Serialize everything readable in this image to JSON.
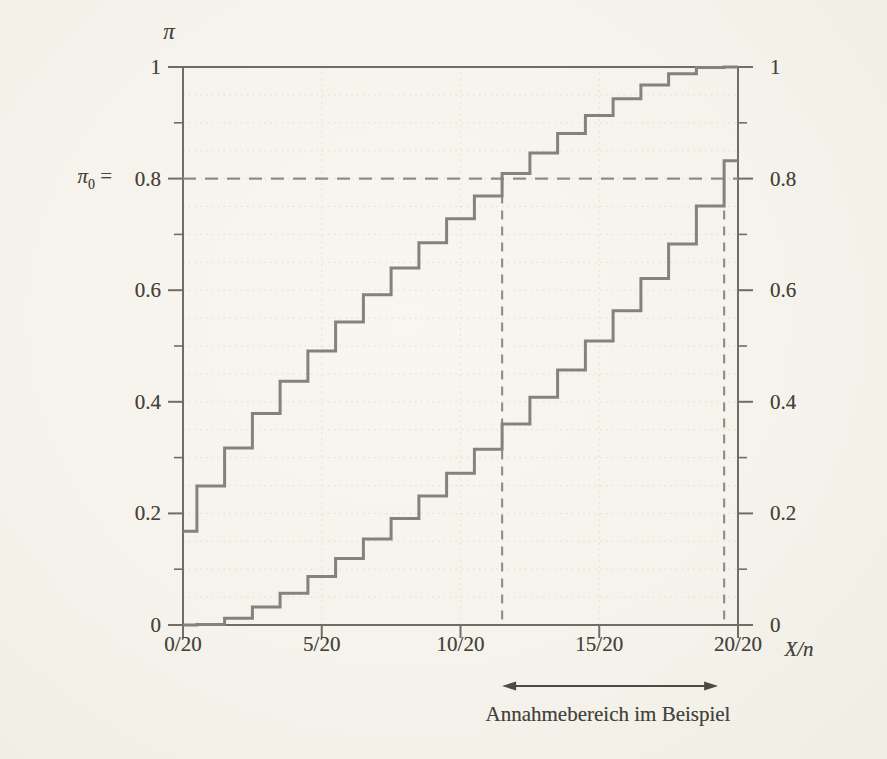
{
  "figure": {
    "pi_axis_title": "π",
    "x_axis_title": "X/n",
    "pi0_label": {
      "pi": "π",
      "sub": "0",
      "eq": " ="
    }
  },
  "axes": {
    "y_left_ticks": [
      {
        "label": "1",
        "value": 1
      },
      {
        "label": "0.8",
        "value": 0.8
      },
      {
        "label": "0.6",
        "value": 0.6
      },
      {
        "label": "0.4",
        "value": 0.4
      },
      {
        "label": "0.2",
        "value": 0.2
      },
      {
        "label": "0",
        "value": 0
      }
    ],
    "y_right_ticks": [
      {
        "label": "1",
        "value": 1
      },
      {
        "label": "0.8",
        "value": 0.8
      },
      {
        "label": "0.6",
        "value": 0.6
      },
      {
        "label": "0.4",
        "value": 0.4
      },
      {
        "label": "0.2",
        "value": 0.2
      },
      {
        "label": "0",
        "value": 0
      }
    ],
    "y_minor_ticks": [
      0.1,
      0.3,
      0.5,
      0.7,
      0.9
    ],
    "x_ticks": [
      {
        "label": "0/20",
        "value": 0
      },
      {
        "label": "5/20",
        "value": 5
      },
      {
        "label": "10/20",
        "value": 10
      },
      {
        "label": "15/20",
        "value": 15
      },
      {
        "label": "20/20",
        "value": 20
      }
    ]
  },
  "chart_data": {
    "type": "line",
    "subtype": "step-confidence-belt",
    "n": 20,
    "x": [
      0,
      1,
      2,
      3,
      4,
      5,
      6,
      7,
      8,
      9,
      10,
      11,
      12,
      13,
      14,
      15,
      16,
      17,
      18,
      19,
      20
    ],
    "series": [
      {
        "name": "upper-confidence-limit",
        "values": [
          0.168,
          0.249,
          0.317,
          0.379,
          0.437,
          0.491,
          0.543,
          0.592,
          0.64,
          0.685,
          0.728,
          0.769,
          0.809,
          0.846,
          0.881,
          0.913,
          0.943,
          0.968,
          0.988,
          0.999,
          1.0
        ]
      },
      {
        "name": "lower-confidence-limit",
        "values": [
          0.0,
          0.001,
          0.012,
          0.032,
          0.057,
          0.087,
          0.119,
          0.154,
          0.191,
          0.231,
          0.272,
          0.315,
          0.36,
          0.408,
          0.457,
          0.509,
          0.563,
          0.621,
          0.683,
          0.751,
          0.832
        ]
      }
    ],
    "pi0": 0.8,
    "acceptance_region": {
      "from_x": 11.5,
      "to_x": 19.5,
      "label": "Annahmebereich im Beispiel"
    },
    "xlabel": "X/n",
    "ylabel": "π",
    "xlim": [
      0,
      20
    ],
    "ylim": [
      0,
      1
    ],
    "grid": {
      "y_step": 0.05,
      "x_lines": [
        5,
        10,
        15
      ]
    },
    "legend_position": "none"
  },
  "colors": {
    "background": "#f6f4ed",
    "curve": "#83837c",
    "dashed": "#8d8d86",
    "axis": "#6e6e67",
    "grid": "#e1ded3",
    "text": "#45433c",
    "arrow": "#4c4a42"
  }
}
